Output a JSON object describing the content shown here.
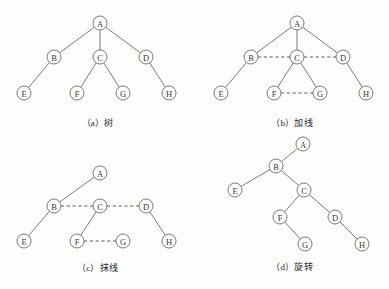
{
  "figure": {
    "node_radius": 7,
    "colors": {
      "background": "#fdfdfb",
      "stroke": "#6b6b6b",
      "dashed_stroke": "#5c5c5c",
      "label": "#3a3a3a"
    }
  },
  "panels": [
    {
      "id": "panel-a",
      "caption": "（a）树",
      "origin": {
        "x": 0,
        "y": 4
      },
      "size": {
        "w": 195,
        "h": 130
      },
      "nodes": [
        {
          "id": "A",
          "label": "A",
          "x": 100,
          "y": 19
        },
        {
          "id": "B",
          "label": "B",
          "x": 54,
          "y": 53
        },
        {
          "id": "C",
          "label": "C",
          "x": 100,
          "y": 53
        },
        {
          "id": "D",
          "label": "D",
          "x": 146,
          "y": 53
        },
        {
          "id": "E",
          "label": "E",
          "x": 24,
          "y": 89
        },
        {
          "id": "F",
          "label": "F",
          "x": 77,
          "y": 89
        },
        {
          "id": "G",
          "label": "G",
          "x": 123,
          "y": 89
        },
        {
          "id": "H",
          "label": "H",
          "x": 169,
          "y": 89
        }
      ],
      "solid_edges": [
        [
          "A",
          "B"
        ],
        [
          "A",
          "C"
        ],
        [
          "A",
          "D"
        ],
        [
          "B",
          "E"
        ],
        [
          "C",
          "F"
        ],
        [
          "C",
          "G"
        ],
        [
          "D",
          "H"
        ]
      ],
      "dashed_edges": [],
      "caption_y": 112
    },
    {
      "id": "panel-b",
      "caption": "（b）加线",
      "origin": {
        "x": 195,
        "y": 4
      },
      "size": {
        "w": 194,
        "h": 130
      },
      "nodes": [
        {
          "id": "A",
          "label": "A",
          "x": 102,
          "y": 19
        },
        {
          "id": "B",
          "label": "B",
          "x": 56,
          "y": 53
        },
        {
          "id": "C",
          "label": "C",
          "x": 102,
          "y": 53
        },
        {
          "id": "D",
          "label": "D",
          "x": 148,
          "y": 53
        },
        {
          "id": "E",
          "label": "E",
          "x": 26,
          "y": 89
        },
        {
          "id": "F",
          "label": "F",
          "x": 79,
          "y": 89
        },
        {
          "id": "G",
          "label": "G",
          "x": 125,
          "y": 89
        },
        {
          "id": "H",
          "label": "H",
          "x": 171,
          "y": 89
        }
      ],
      "solid_edges": [
        [
          "A",
          "B"
        ],
        [
          "A",
          "C"
        ],
        [
          "A",
          "D"
        ],
        [
          "B",
          "E"
        ],
        [
          "C",
          "F"
        ],
        [
          "C",
          "G"
        ],
        [
          "D",
          "H"
        ]
      ],
      "dashed_edges": [
        [
          "B",
          "C"
        ],
        [
          "C",
          "D"
        ],
        [
          "F",
          "G"
        ]
      ],
      "caption_y": 112
    },
    {
      "id": "panel-c",
      "caption": "（c）抹线",
      "origin": {
        "x": 0,
        "y": 148
      },
      "size": {
        "w": 195,
        "h": 130
      },
      "nodes": [
        {
          "id": "A",
          "label": "A",
          "x": 100,
          "y": 25
        },
        {
          "id": "B",
          "label": "B",
          "x": 54,
          "y": 58
        },
        {
          "id": "C",
          "label": "C",
          "x": 100,
          "y": 58
        },
        {
          "id": "D",
          "label": "D",
          "x": 146,
          "y": 58
        },
        {
          "id": "E",
          "label": "E",
          "x": 24,
          "y": 93
        },
        {
          "id": "F",
          "label": "F",
          "x": 77,
          "y": 93
        },
        {
          "id": "G",
          "label": "G",
          "x": 123,
          "y": 93
        },
        {
          "id": "H",
          "label": "H",
          "x": 169,
          "y": 93
        }
      ],
      "solid_edges": [
        [
          "A",
          "B"
        ],
        [
          "B",
          "E"
        ],
        [
          "C",
          "F"
        ],
        [
          "D",
          "H"
        ]
      ],
      "dashed_edges": [
        [
          "B",
          "C"
        ],
        [
          "C",
          "D"
        ],
        [
          "F",
          "G"
        ]
      ],
      "caption_y": 113
    },
    {
      "id": "panel-d",
      "caption": "（d）旋转",
      "origin": {
        "x": 195,
        "y": 132
      },
      "size": {
        "w": 194,
        "h": 146
      },
      "nodes": [
        {
          "id": "A",
          "label": "A",
          "x": 108,
          "y": 12
        },
        {
          "id": "B",
          "label": "B",
          "x": 81,
          "y": 34
        },
        {
          "id": "E",
          "label": "E",
          "x": 40,
          "y": 58
        },
        {
          "id": "C",
          "label": "C",
          "x": 109,
          "y": 58
        },
        {
          "id": "F",
          "label": "F",
          "x": 85,
          "y": 85
        },
        {
          "id": "D",
          "label": "D",
          "x": 140,
          "y": 85
        },
        {
          "id": "G",
          "label": "G",
          "x": 110,
          "y": 112
        },
        {
          "id": "H",
          "label": "H",
          "x": 167,
          "y": 112
        }
      ],
      "solid_edges": [
        [
          "A",
          "B"
        ],
        [
          "B",
          "E"
        ],
        [
          "B",
          "C"
        ],
        [
          "C",
          "F"
        ],
        [
          "C",
          "D"
        ],
        [
          "F",
          "G"
        ],
        [
          "D",
          "H"
        ]
      ],
      "dashed_edges": [],
      "caption_y": 128
    }
  ]
}
